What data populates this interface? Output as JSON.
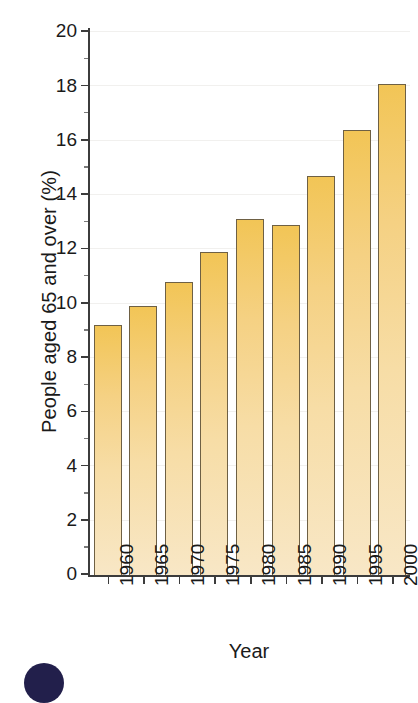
{
  "chart_data": {
    "type": "bar",
    "title": "",
    "xlabel": "Year",
    "ylabel": "People aged 65 and over (%)",
    "categories": [
      "1960",
      "1965",
      "1970",
      "1975",
      "1980",
      "1985",
      "1990",
      "1995",
      "2000"
    ],
    "values": [
      9.2,
      9.9,
      10.8,
      11.9,
      13.1,
      12.9,
      14.7,
      16.4,
      18.1
    ],
    "ylim": [
      0,
      20
    ],
    "ytick_labels": [
      "0",
      "2",
      "4",
      "6",
      "8",
      "10",
      "12",
      "14",
      "16",
      "18",
      "20"
    ],
    "ytick_values": [
      0,
      2,
      4,
      6,
      8,
      10,
      12,
      14,
      16,
      18,
      20
    ],
    "minor_tick_step": 1,
    "grid": false,
    "legend": "none",
    "bar_color_top": "#F2C556",
    "bar_color_bottom": "#F8E7C6",
    "bar_edge_color": "#6E6044",
    "axis_color": "#3C3C3C"
  },
  "figure": {
    "badge_color": "#221F4B"
  }
}
